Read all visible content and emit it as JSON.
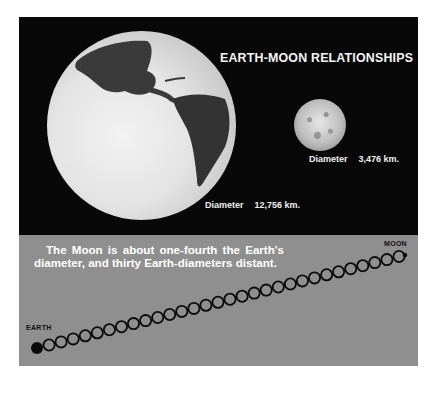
{
  "title": "EARTH-MOON RELATIONSHIPS",
  "earth": {
    "diameter_label": "Diameter",
    "diameter_value": "12,756 km."
  },
  "moon": {
    "diameter_label": "Diameter",
    "diameter_value": "3,476 km."
  },
  "caption": "The Moon is about one-fourth the Earth's diameter, and thirty Earth-diameters distant.",
  "chain": {
    "start_label": "EARTH",
    "end_label": "MOON",
    "ring_count": 30,
    "start": [
      37,
      348
    ],
    "end": [
      405,
      255
    ]
  },
  "colors": {
    "dark_panel": "#080808",
    "gray_panel": "#8f8f8f",
    "ring_stroke": "#0a0a0a"
  }
}
